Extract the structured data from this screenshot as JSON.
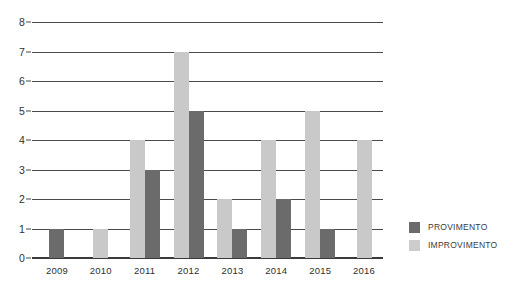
{
  "chart_data": {
    "type": "bar",
    "title": "",
    "subtitle": "",
    "xlabel": "",
    "ylabel": "",
    "categories": [
      "2009",
      "2010",
      "2011",
      "2012",
      "2013",
      "2014",
      "2015",
      "2016"
    ],
    "series": [
      {
        "name": "IMPROVIMENTO",
        "color": "#c9c9c9",
        "values": [
          0,
          1,
          4,
          7,
          2,
          4,
          5,
          4
        ]
      },
      {
        "name": "PROVIMENTO",
        "color": "#6b6b6b",
        "values": [
          1,
          0,
          3,
          5,
          1,
          2,
          1,
          0
        ]
      }
    ],
    "ylim": [
      0,
      8
    ],
    "y_ticks": [
      "0",
      "1",
      "2",
      "3",
      "4",
      "5",
      "6",
      "7",
      "8"
    ],
    "y_tick_step": 1,
    "grid": true,
    "grid_axis": "y",
    "legend_position": "right",
    "bar_order_in_group": [
      "IMPROVIMENTO",
      "PROVIMENTO"
    ],
    "background_color": "#ffffff",
    "axis_color": "#4a4a4a"
  },
  "legend": {
    "entries": [
      {
        "label": "PROVIMENTO",
        "color": "#6b6b6b"
      },
      {
        "label": "IMPROVIMENTO",
        "color": "#cccccc"
      }
    ]
  }
}
